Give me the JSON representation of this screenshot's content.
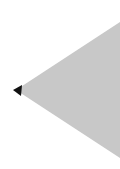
{
  "canvas": {
    "width": 120,
    "height": 169,
    "background": "#ffffff"
  },
  "shapes": {
    "triangle": {
      "icon": "triangle-left-icon",
      "fill": "#c8c8c8",
      "points": "120,22 16,90 120,158"
    },
    "arrowhead": {
      "icon": "arrow-left-icon",
      "fill": "#111111",
      "points": "13,90 22,85 21,96"
    }
  }
}
